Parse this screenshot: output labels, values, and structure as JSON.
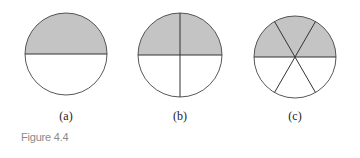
{
  "figure": {
    "caption": "Figure 4.4",
    "shade_color": "#c4c4c4",
    "stroke_color": "#333333",
    "panels": [
      {
        "label": "(a)",
        "parts": 2,
        "shaded": 1,
        "description": "circle divided into 2 equal parts, top half shaded"
      },
      {
        "label": "(b)",
        "parts": 4,
        "shaded": 2,
        "description": "circle divided into 4 equal parts, top 2 shaded"
      },
      {
        "label": "(c)",
        "parts": 6,
        "shaded": 3,
        "description": "circle divided into 6 equal parts, top 3 shaded"
      }
    ]
  }
}
